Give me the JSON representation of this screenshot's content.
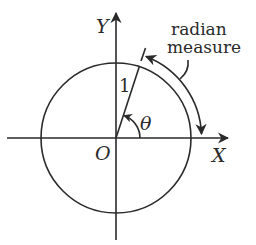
{
  "diagram": {
    "type": "unit-circle",
    "labels": {
      "y_axis": "Y",
      "x_axis": "X",
      "origin": "O",
      "radius": "1",
      "angle": "θ",
      "annotation_line1": "radian",
      "annotation_line2": "measure"
    },
    "geometry": {
      "center": [
        116,
        138
      ],
      "radius": 75,
      "angle_deg": 72
    },
    "colors": {
      "ink": "#2a2a2a",
      "background": "#ffffff"
    }
  }
}
